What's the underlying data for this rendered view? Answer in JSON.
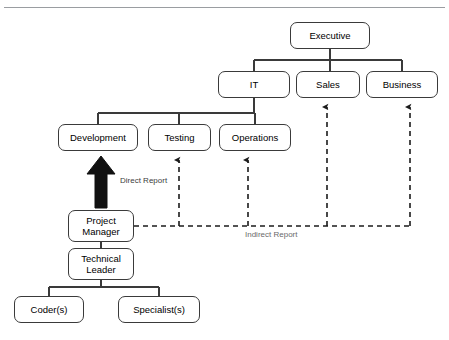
{
  "page": {
    "top_clipped_text": "",
    "background_color": "#ffffff",
    "line_color": "#3a3a3a",
    "text_color": "#000000"
  },
  "diagram": {
    "type": "organizational-chart",
    "title": "",
    "nodes": [
      {
        "id": "executive",
        "label": "Executive",
        "level": 0,
        "x": 290,
        "y": 14,
        "w": 80,
        "h": 27
      },
      {
        "id": "it",
        "label": "IT",
        "level": 1,
        "x": 218,
        "y": 63,
        "w": 72,
        "h": 27
      },
      {
        "id": "sales",
        "label": "Sales",
        "level": 1,
        "x": 296,
        "y": 63,
        "w": 64,
        "h": 27
      },
      {
        "id": "business",
        "label": "Business",
        "level": 1,
        "x": 366,
        "y": 63,
        "w": 72,
        "h": 27
      },
      {
        "id": "development",
        "label": "Development",
        "level": 2,
        "x": 58,
        "y": 116,
        "w": 80,
        "h": 27
      },
      {
        "id": "testing",
        "label": "Testing",
        "level": 2,
        "x": 148,
        "y": 116,
        "w": 63,
        "h": 27
      },
      {
        "id": "operations",
        "label": "Operations",
        "level": 2,
        "x": 219,
        "y": 116,
        "w": 72,
        "h": 27
      },
      {
        "id": "project-manager",
        "label": "Project\nManager",
        "level": 3,
        "x": 68,
        "y": 202,
        "w": 66,
        "h": 32
      },
      {
        "id": "technical-leader",
        "label": "Technical\nLeader",
        "level": 4,
        "x": 68,
        "y": 240,
        "w": 66,
        "h": 32
      },
      {
        "id": "coders",
        "label": "Coder(s)",
        "level": 5,
        "x": 14,
        "y": 288,
        "w": 70,
        "h": 27
      },
      {
        "id": "specialists",
        "label": "Specialist(s)",
        "level": 5,
        "x": 118,
        "y": 288,
        "w": 82,
        "h": 27
      }
    ],
    "edges": [
      {
        "from": "executive",
        "to": "it",
        "kind": "solid"
      },
      {
        "from": "executive",
        "to": "sales",
        "kind": "solid"
      },
      {
        "from": "executive",
        "to": "business",
        "kind": "solid"
      },
      {
        "from": "it",
        "to": "development",
        "kind": "solid"
      },
      {
        "from": "it",
        "to": "testing",
        "kind": "solid"
      },
      {
        "from": "it",
        "to": "operations",
        "kind": "solid"
      },
      {
        "from": "project-manager",
        "to": "development",
        "kind": "block-arrow",
        "label": "Direct Report"
      },
      {
        "from": "project-manager",
        "to": "technical-leader",
        "kind": "solid"
      },
      {
        "from": "technical-leader",
        "to": "coders",
        "kind": "solid"
      },
      {
        "from": "technical-leader",
        "to": "specialists",
        "kind": "solid"
      },
      {
        "from": "project-manager",
        "to": "testing",
        "kind": "dashed-arrow",
        "label": "Indirect Report"
      },
      {
        "from": "project-manager",
        "to": "operations",
        "kind": "dashed-arrow"
      },
      {
        "from": "project-manager",
        "to": "sales",
        "kind": "dashed-arrow"
      },
      {
        "from": "project-manager",
        "to": "business",
        "kind": "dashed-arrow"
      }
    ],
    "labels": {
      "direct_report": "Direct Report",
      "indirect_report": "Indirect Report"
    }
  }
}
